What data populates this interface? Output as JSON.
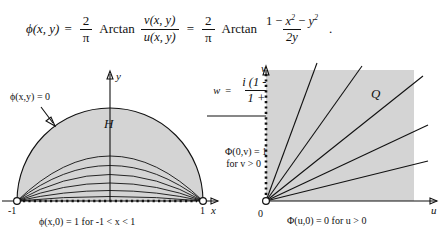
{
  "formula": {
    "lhs": "ϕ(x, y)",
    "equals": "=",
    "coef_num": "2",
    "coef_den": "π",
    "arctan": "Arctan",
    "ratio_num": "v(x, y)",
    "ratio_den": "u(x, y)",
    "equals2": "=",
    "coef2_num": "2",
    "coef2_den": "π",
    "arctan2": "Arctan",
    "expr_num_1": "1",
    "expr_num_minus1": "−",
    "expr_num_x": "x",
    "expr_num_x_pow": "2",
    "expr_num_minus2": "−",
    "expr_num_y": "y",
    "expr_num_y_pow": "2",
    "expr_den": "2y",
    "period": "."
  },
  "map": {
    "w": "w",
    "equals": "=",
    "numerator": "i (1 - z)",
    "denominator": "1 + z",
    "arrow": "→"
  },
  "left_diagram": {
    "region_label": "H",
    "x_axis_label": "x",
    "y_axis_label": "y",
    "tick_left": "-1",
    "tick_right": "1",
    "boundary_arc_label": "ϕ(x,y) = 0",
    "boundary_base_label": "ϕ(x,0) = 1   for  -1 < x < 1",
    "level_curve_count": 6
  },
  "right_diagram": {
    "region_label": "Q",
    "u_axis_label": "u",
    "v_axis_label": "v",
    "origin_label": "0",
    "v_boundary_line1": "Φ(0,v) = 1",
    "v_boundary_line2": "for  v > 0",
    "u_boundary_label": "Φ(u,0) = 0   for  u > 0",
    "ray_count": 6
  },
  "colors": {
    "region_fill": "#d4d4d4",
    "stroke": "#111111",
    "background": "#ffffff"
  }
}
